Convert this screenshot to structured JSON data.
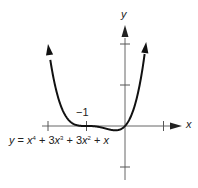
{
  "chart_data": {
    "type": "line",
    "title": "",
    "equation_label": "y = x⁴ + 3x³ + 3x² + x",
    "xlabel": "x",
    "ylabel": "y",
    "xlim": [
      -2.0,
      1.6
    ],
    "ylim": [
      -1.2,
      2.3
    ],
    "x_ticks": [
      -2,
      -1,
      1
    ],
    "y_ticks": [
      -1,
      1,
      2
    ],
    "tick_labels": [
      {
        "axis": "x",
        "value": -1,
        "label": "−1"
      }
    ],
    "grid": false,
    "legend": null,
    "series": [
      {
        "name": "y = x^4 + 3x^3 + 3x^2 + x",
        "x": [
          -2.0,
          -1.9,
          -1.8,
          -1.7,
          -1.6,
          -1.5,
          -1.4,
          -1.3,
          -1.2,
          -1.1,
          -1.0,
          -0.9,
          -0.8,
          -0.7,
          -0.6,
          -0.5,
          -0.4,
          -0.3,
          -0.2,
          -0.1,
          0.0,
          0.1,
          0.2,
          0.3,
          0.4,
          0.5,
          0.55
        ],
        "y": [
          2.0,
          1.385,
          0.922,
          0.583,
          0.346,
          0.188,
          0.09,
          0.035,
          0.01,
          0.001,
          0.0,
          -0.001,
          -0.006,
          -0.019,
          -0.038,
          -0.063,
          -0.086,
          -0.103,
          -0.102,
          -0.073,
          0.0,
          0.133,
          0.346,
          0.659,
          1.098,
          1.688,
          2.048
        ]
      }
    ]
  },
  "axes": {
    "x_label": "x",
    "y_label": "y",
    "tick_minus_one": "−1"
  },
  "equation": {
    "y": "y",
    "eq": " = ",
    "t1": "x",
    "p1": "4",
    "plus1": " + 3",
    "t2": "x",
    "p2": "3",
    "plus2": " + 3",
    "t3": "x",
    "p3": "2",
    "plus3": " + ",
    "t4": "x"
  }
}
